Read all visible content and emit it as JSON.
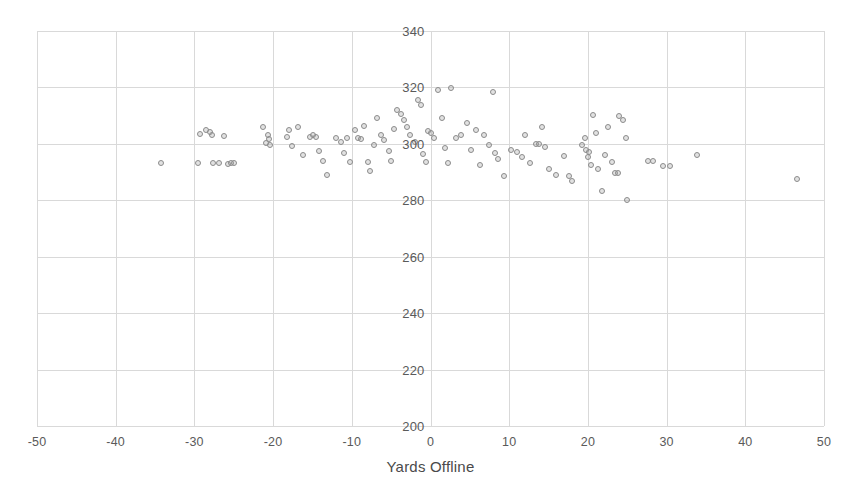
{
  "chart_data": {
    "type": "scatter",
    "title": "",
    "xlabel": "Yards Offline",
    "ylabel": "",
    "xlim": [
      -50,
      50
    ],
    "ylim": [
      200,
      340
    ],
    "xticks": [
      -50,
      -40,
      -30,
      -20,
      -10,
      0,
      10,
      20,
      30,
      40,
      50
    ],
    "yticks": [
      200,
      220,
      240,
      260,
      280,
      300,
      320,
      340
    ],
    "xtick_labels": [
      "-50",
      "-40",
      "-30",
      "-20",
      "-10",
      "0",
      "10",
      "20",
      "30",
      "40",
      "50"
    ],
    "ytick_labels": [
      "200",
      "220",
      "240",
      "260",
      "280",
      "300",
      "320",
      "340"
    ],
    "grid": true,
    "legend": null,
    "marker": {
      "shape": "circle-open",
      "stroke_color": "#8c8c8c",
      "fill_color": "rgba(160,160,160,0.30)",
      "size_px": 6
    },
    "grid_color": "#d9d9d9",
    "series": [
      {
        "name": "Drives",
        "points": [
          [
            -34.3,
            293.2
          ],
          [
            -29.6,
            293.2
          ],
          [
            -29.3,
            303.6
          ],
          [
            -28.5,
            305.0
          ],
          [
            -28.0,
            304.3
          ],
          [
            -27.8,
            303.0
          ],
          [
            -27.6,
            293.2
          ],
          [
            -26.9,
            293.3
          ],
          [
            -26.2,
            302.8
          ],
          [
            -25.7,
            293.0
          ],
          [
            -25.3,
            293.2
          ],
          [
            -25.0,
            293.1
          ],
          [
            -21.3,
            305.8
          ],
          [
            -20.9,
            300.3
          ],
          [
            -20.6,
            303.2
          ],
          [
            -20.5,
            301.6
          ],
          [
            -20.4,
            299.7
          ],
          [
            -18.2,
            302.5
          ],
          [
            -18.0,
            304.9
          ],
          [
            -17.6,
            299.2
          ],
          [
            -16.8,
            306.0
          ],
          [
            -16.2,
            296.0
          ],
          [
            -15.3,
            302.3
          ],
          [
            -14.9,
            303.0
          ],
          [
            -14.5,
            302.6
          ],
          [
            -14.2,
            297.5
          ],
          [
            -13.6,
            294.0
          ],
          [
            -13.2,
            288.9
          ],
          [
            -12.0,
            301.9
          ],
          [
            -11.4,
            300.7
          ],
          [
            -11.0,
            296.6
          ],
          [
            -10.6,
            302.1
          ],
          [
            -10.2,
            293.7
          ],
          [
            -9.6,
            304.8
          ],
          [
            -9.2,
            302.0
          ],
          [
            -8.8,
            301.8
          ],
          [
            -8.5,
            306.5
          ],
          [
            -8.0,
            293.4
          ],
          [
            -7.7,
            290.5
          ],
          [
            -7.2,
            299.6
          ],
          [
            -6.8,
            309.0
          ],
          [
            -6.3,
            303.3
          ],
          [
            -5.9,
            301.3
          ],
          [
            -5.3,
            297.4
          ],
          [
            -5.0,
            294.0
          ],
          [
            -4.6,
            305.1
          ],
          [
            -4.2,
            312.0
          ],
          [
            -3.8,
            310.7
          ],
          [
            -3.4,
            308.6
          ],
          [
            -3.0,
            306.0
          ],
          [
            -2.6,
            303.3
          ],
          [
            -2.0,
            300.5
          ],
          [
            -1.6,
            315.6
          ],
          [
            -1.2,
            313.6
          ],
          [
            -1.0,
            296.4
          ],
          [
            -0.6,
            293.4
          ],
          [
            -0.3,
            304.6
          ],
          [
            0.0,
            303.8
          ],
          [
            0.4,
            302.0
          ],
          [
            1.0,
            319.0
          ],
          [
            1.4,
            309.0
          ],
          [
            1.8,
            298.4
          ],
          [
            2.2,
            293.2
          ],
          [
            2.6,
            319.8
          ],
          [
            3.3,
            301.9
          ],
          [
            3.9,
            303.0
          ],
          [
            4.6,
            307.5
          ],
          [
            5.2,
            297.8
          ],
          [
            5.8,
            305.0
          ],
          [
            6.3,
            292.5
          ],
          [
            6.8,
            303.2
          ],
          [
            7.4,
            299.6
          ],
          [
            7.9,
            318.5
          ],
          [
            8.2,
            296.6
          ],
          [
            8.6,
            294.6
          ],
          [
            9.4,
            288.5
          ],
          [
            10.2,
            298.0
          ],
          [
            11.0,
            297.2
          ],
          [
            11.6,
            295.5
          ],
          [
            12.0,
            303.1
          ],
          [
            12.6,
            293.1
          ],
          [
            13.4,
            300.1
          ],
          [
            13.8,
            300.1
          ],
          [
            14.2,
            305.8
          ],
          [
            14.6,
            299.0
          ],
          [
            15.0,
            291.2
          ],
          [
            16.0,
            289.0
          ],
          [
            17.0,
            295.6
          ],
          [
            17.6,
            288.5
          ],
          [
            18.0,
            286.8
          ],
          [
            19.3,
            299.5
          ],
          [
            19.6,
            302.2
          ],
          [
            19.8,
            298.0
          ],
          [
            20.0,
            295.3
          ],
          [
            20.2,
            297.0
          ],
          [
            20.4,
            292.5
          ],
          [
            20.6,
            310.4
          ],
          [
            21.0,
            304.0
          ],
          [
            21.3,
            291.1
          ],
          [
            21.8,
            283.2
          ],
          [
            22.2,
            296.0
          ],
          [
            22.6,
            306.0
          ],
          [
            23.0,
            293.6
          ],
          [
            23.4,
            289.8
          ],
          [
            23.8,
            289.5
          ],
          [
            24.0,
            310.0
          ],
          [
            24.4,
            308.4
          ],
          [
            24.8,
            302.2
          ],
          [
            25.0,
            280.0
          ],
          [
            27.6,
            293.8
          ],
          [
            28.3,
            293.9
          ],
          [
            29.6,
            292.2
          ],
          [
            30.4,
            292.0
          ],
          [
            33.8,
            296.2
          ],
          [
            46.6,
            287.4
          ]
        ]
      }
    ]
  }
}
